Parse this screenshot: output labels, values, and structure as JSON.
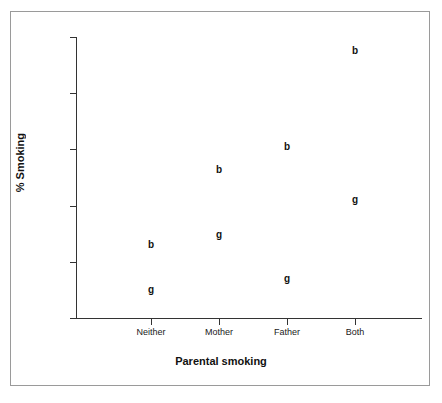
{
  "chart_data": {
    "type": "scatter",
    "title": "",
    "xlabel": "Parental smoking",
    "ylabel": "% Smoking",
    "categories": [
      "Neither",
      "Mother",
      "Father",
      "Both"
    ],
    "ylim": [
      0,
      10
    ],
    "yticks": [
      0,
      2,
      4,
      6,
      8,
      10
    ],
    "ytick_labels": [
      "0",
      "2",
      "4",
      "6",
      "8",
      "10"
    ],
    "grid": false,
    "legend": "none",
    "marker_style": "text-letter",
    "series": [
      {
        "name": "b",
        "label": "b",
        "marker": "b",
        "values": [
          2.6,
          5.25,
          6.1,
          9.5
        ]
      },
      {
        "name": "g",
        "label": "g",
        "marker": "g",
        "values": [
          1.0,
          2.95,
          1.4,
          4.2
        ]
      }
    ],
    "points": [
      {
        "category": "Neither",
        "series": "b",
        "marker": "b",
        "value": 2.6
      },
      {
        "category": "Neither",
        "series": "g",
        "marker": "g",
        "value": 1.0
      },
      {
        "category": "Mother",
        "series": "b",
        "marker": "b",
        "value": 5.25
      },
      {
        "category": "Mother",
        "series": "g",
        "marker": "g",
        "value": 2.95
      },
      {
        "category": "Father",
        "series": "b",
        "marker": "b",
        "value": 6.1
      },
      {
        "category": "Father",
        "series": "g",
        "marker": "g",
        "value": 1.4
      },
      {
        "category": "Both",
        "series": "b",
        "marker": "b",
        "value": 9.5
      },
      {
        "category": "Both",
        "series": "g",
        "marker": "g",
        "value": 4.2
      }
    ]
  },
  "colors": {
    "frame": "#9a9a9a",
    "axis": "#333333",
    "text": "#111111",
    "background": "#ffffff"
  }
}
